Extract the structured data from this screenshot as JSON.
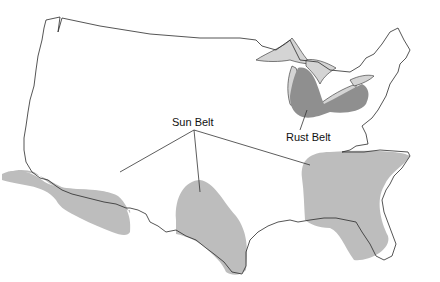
{
  "map": {
    "title": "",
    "subject": "United States",
    "colors": {
      "background": "#ffffff",
      "outline": "#2a2a2a",
      "sun_belt_fill": "#bdbdbd",
      "rust_belt_fill": "#8f8f8f",
      "lakes_fill": "#d4d4d4"
    },
    "regions": [
      {
        "name": "Sun Belt",
        "label": "Sun Belt",
        "areas": [
          "Southern California / Arizona",
          "Texas",
          "Southeast / Florida"
        ]
      },
      {
        "name": "Rust Belt",
        "label": "Rust Belt",
        "areas": [
          "Michigan / Ohio / Pennsylvania / Indiana"
        ]
      }
    ],
    "labels": {
      "sun_belt": "Sun Belt",
      "rust_belt": "Rust Belt"
    }
  }
}
